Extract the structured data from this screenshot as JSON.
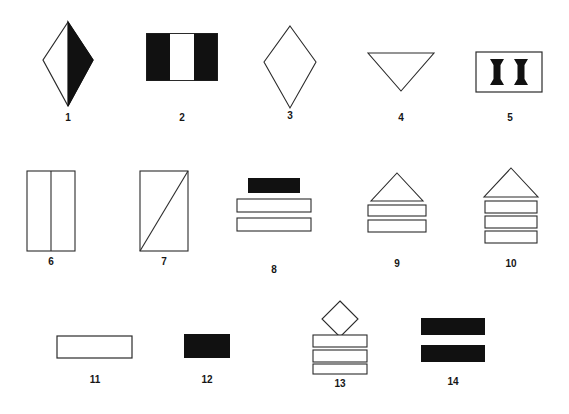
{
  "plate": {
    "background_color": "#ffffff",
    "stroke_color": "#2b2b2b",
    "fill_color": "#111111",
    "label_color": "#161616",
    "width": 569,
    "height": 414,
    "rows": 3,
    "columns": [
      5,
      5,
      4
    ]
  },
  "figures": [
    {
      "label": "1",
      "description": "rhombus with right half filled black, left half white outline",
      "row": 1,
      "column": 1,
      "shape": "half-filled-diamond"
    },
    {
      "label": "2",
      "description": "rectangle with black left and right thirds and white middle third",
      "row": 1,
      "column": 2,
      "shape": "vertical-thirds-rectangle"
    },
    {
      "label": "3",
      "description": "tall rhombus outline, unfilled",
      "row": 1,
      "column": 3,
      "shape": "diamond-outline"
    },
    {
      "label": "4",
      "description": "downward pointing triangle outline",
      "row": 1,
      "column": 4,
      "shape": "triangle-down-outline"
    },
    {
      "label": "5",
      "description": "rectangle outline containing two black hourglass bars",
      "row": 1,
      "column": 5,
      "shape": "rectangle-with-two-hourglasses"
    },
    {
      "label": "6",
      "description": "vertical rectangle outline split by a vertical center line",
      "row": 2,
      "column": 1,
      "shape": "rectangle-vertical-divider"
    },
    {
      "label": "7",
      "description": "vertical rectangle outline with diagonal from bottom-left to top-right",
      "row": 2,
      "column": 2,
      "shape": "rectangle-diagonal"
    },
    {
      "label": "8",
      "description": "black filled bar above two white outlined bars",
      "row": 2,
      "column": 3,
      "shape": "black-bar-over-two-bars"
    },
    {
      "label": "9",
      "description": "upward triangle above two white outlined bars",
      "row": 2,
      "column": 4,
      "shape": "triangle-over-two-bars"
    },
    {
      "label": "10",
      "description": "upward triangle above three white outlined bars",
      "row": 2,
      "column": 5,
      "shape": "triangle-over-three-bars"
    },
    {
      "label": "11",
      "description": "single white outlined horizontal bar",
      "row": 3,
      "column": 1,
      "shape": "single-outlined-bar"
    },
    {
      "label": "12",
      "description": "single solid black rectangle",
      "row": 3,
      "column": 2,
      "shape": "solid-black-rectangle"
    },
    {
      "label": "13",
      "description": "diamond above three white outlined bars",
      "row": 3,
      "column": 3,
      "shape": "diamond-over-three-bars"
    },
    {
      "label": "14",
      "description": "two solid black horizontal bars",
      "row": 3,
      "column": 4,
      "shape": "two-black-bars"
    }
  ]
}
